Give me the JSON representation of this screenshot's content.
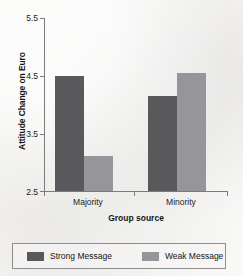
{
  "chart_data": {
    "type": "bar",
    "title": "",
    "xlabel": "Group source",
    "ylabel": "Attitude Change on Euro",
    "categories": [
      "Majority",
      "Minority"
    ],
    "ylim": [
      2.5,
      5.5
    ],
    "yticks": [
      2.5,
      3.5,
      4.5,
      5.5
    ],
    "ytick_labels": [
      "2.5",
      "3.5",
      "4.5",
      "5.5"
    ],
    "grid": false,
    "legend_position": "bottom",
    "series": [
      {
        "name": "Strong Message",
        "color": "#59595b",
        "values": [
          4.5,
          4.15
        ]
      },
      {
        "name": "Weak Message",
        "color": "#96969a",
        "values": [
          3.1,
          4.55
        ]
      }
    ]
  },
  "axes": {
    "y_title": "Attitude Change on Euro",
    "x_title": "Group source",
    "tick_0": "2.5",
    "tick_1": "3.5",
    "tick_2": "4.5",
    "tick_3": "5.5",
    "cat_0": "Majority",
    "cat_1": "Minority"
  },
  "legend": {
    "strong_label": "Strong Message",
    "weak_label": "Weak Message"
  },
  "colors": {
    "strong": "#59595b",
    "weak": "#96969a",
    "axis": "#7b7b7b",
    "background": "#f2f1ef",
    "text": "#1a1a1a"
  }
}
